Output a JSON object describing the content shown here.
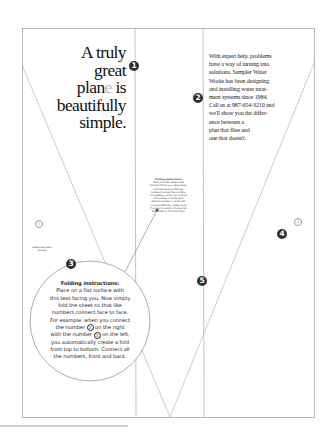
{
  "headline": {
    "line1": "A truly",
    "line2": "great",
    "line3_a": "plan",
    "line3_b": "e",
    "line3_c": " is",
    "line4": "beautifully",
    "line5": "simple."
  },
  "body_copy": {
    "lines": [
      "With expert help, problems",
      "have a way of turning into",
      "solutions. Sampler Water",
      "Works has been designing",
      "and installing water treat-",
      "ment systems since 1984.",
      "Call us at 987-654-3210 and",
      "we'll show you the differ-",
      "ence between a",
      "plan that flies and",
      "one that doesn't."
    ]
  },
  "badges": [
    "1",
    "2",
    "3",
    "4",
    "5"
  ],
  "fold_marks": {
    "left": "1",
    "right": "1"
  },
  "tiny_note": "Staple here when finished",
  "folding_instructions": {
    "title": "Folding instructions:",
    "l1": "Place on a flat surface with",
    "l2": "this text facing you. Now simply",
    "l3": "fold the sheet so that like",
    "l4": "numbers connect face to face.",
    "l5": "For example, when you connect",
    "l6a": "the number ",
    "num": "1",
    "l6b": " on the right",
    "l7a": "with the number ",
    "l7b": " on the left,",
    "l8": "you automatically create a fold",
    "l9": "from top to bottom. Connect all",
    "l10": "the numbers, front and back."
  }
}
